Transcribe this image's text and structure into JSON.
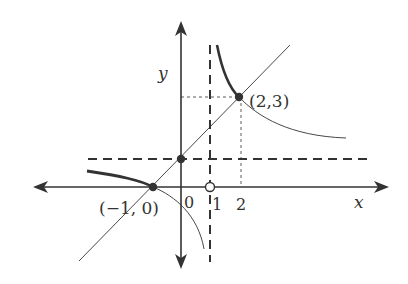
{
  "diagram": {
    "type": "function-graph",
    "colors": {
      "ink": "#333333",
      "background": "#ffffff"
    },
    "axes": {
      "x_label": "x",
      "y_label": "y",
      "origin_label": "0",
      "x_ticks": [
        {
          "value": 1,
          "label": "1"
        },
        {
          "value": 2,
          "label": "2"
        }
      ]
    },
    "asymptotes": [
      {
        "kind": "vertical",
        "equation": "x = 1",
        "style": "dashed"
      },
      {
        "kind": "horizontal",
        "equation": "y = 1",
        "style": "dashed"
      }
    ],
    "line": {
      "description": "y = x + 1",
      "style": "thin solid"
    },
    "curve": {
      "description": "hyperbola with asymptotes x = 1 and y = 1",
      "style": "thin solid, thick segments on highlighted parts"
    },
    "points": [
      {
        "label": "(−1, 0)",
        "x": -1,
        "y": 0,
        "filled": true
      },
      {
        "label": "",
        "x": 0,
        "y": 1,
        "filled": true
      },
      {
        "label": "(2,3)",
        "x": 2,
        "y": 3,
        "filled": true
      },
      {
        "label": "",
        "x": 1,
        "y": 0,
        "filled": false
      }
    ],
    "guide_lines": [
      {
        "from": "(2,3)",
        "to": "x-axis",
        "style": "thin dashed"
      },
      {
        "from": "(2,3)",
        "to": "y-axis",
        "style": "thin dashed"
      }
    ]
  }
}
